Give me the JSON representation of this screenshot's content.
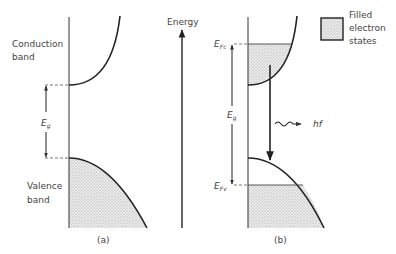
{
  "diagram": {
    "axis_label": "Energy",
    "panel_a": {
      "caption": "(a)",
      "conduction_label_line1": "Conduction",
      "conduction_label_line2": "band",
      "valence_label_line1": "Valence",
      "valence_label_line2": "band",
      "gap_label": "E",
      "gap_sub": "g"
    },
    "panel_b": {
      "caption": "(b)",
      "fermi_c_label": "E",
      "fermi_c_sub": "Fc",
      "fermi_v_label": "E",
      "fermi_v_sub": "Fv",
      "gap_label": "E",
      "gap_sub": "g",
      "photon_label": "hf"
    },
    "legend": {
      "line1": "Filled",
      "line2": "electron",
      "line3": "states"
    },
    "colors": {
      "line": "#222222",
      "fill_dots": "#9a9a9a",
      "fill_bg": "#ececec",
      "text": "#444444"
    }
  }
}
